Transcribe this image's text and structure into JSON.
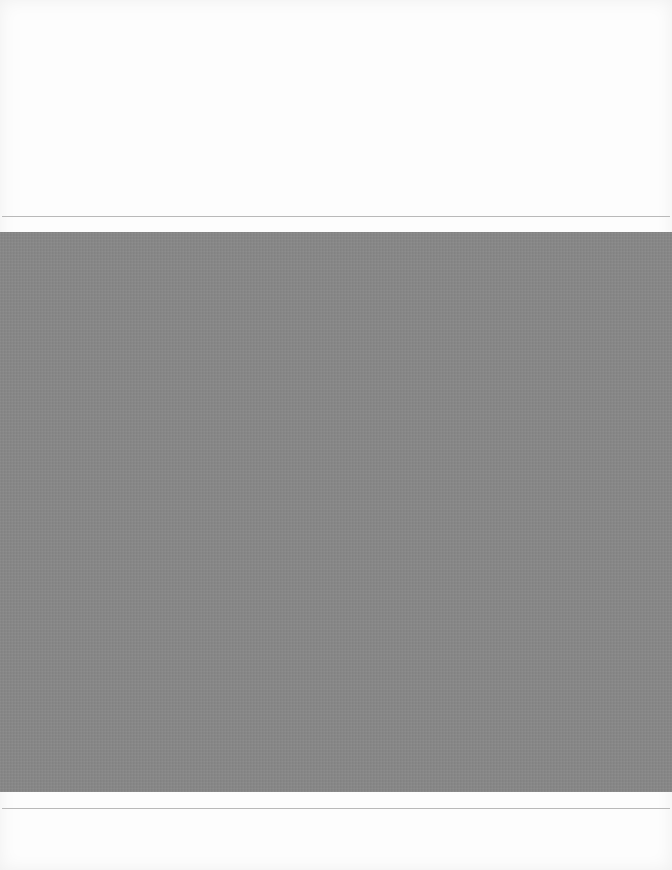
{
  "document": {
    "type": "scanned-page",
    "top_area": {
      "text": ""
    },
    "image_block": {
      "fill_color": "#888888",
      "caption": ""
    },
    "bottom_area": {
      "text": ""
    },
    "rule_color": "#b9b9b9"
  }
}
